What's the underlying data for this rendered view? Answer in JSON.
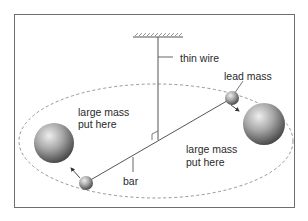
{
  "diagram": {
    "labels": {
      "thin_wire": "thin wire",
      "lead_mass": "lead mass",
      "large_mass_left_line1": "large mass",
      "large_mass_left_line2": "put here",
      "large_mass_right_line1": "large mass",
      "large_mass_right_line2": "put here",
      "bar": "bar"
    },
    "colors": {
      "frame": "#6e6e6e",
      "line": "#555555",
      "dashed_path": "#8a8a8a",
      "sphere_light": "#e6e6e6",
      "sphere_mid": "#9a9a9a",
      "sphere_dark": "#3c3c3c",
      "text": "#2a2a2a"
    }
  }
}
